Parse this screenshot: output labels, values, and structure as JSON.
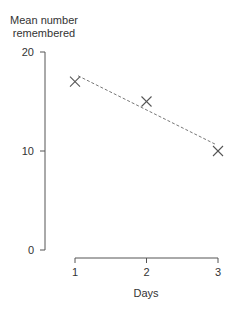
{
  "chart_data": {
    "type": "line",
    "title": "",
    "xlabel": "Days",
    "ylabel": "Mean number remembered",
    "ylabel_lines": [
      "Mean number",
      "remembered"
    ],
    "categories": [
      1,
      2,
      3
    ],
    "x": [
      1,
      2,
      3
    ],
    "series": [
      {
        "name": "Observed",
        "marker": "x",
        "values": [
          17,
          15,
          10
        ]
      }
    ],
    "trend_line": {
      "style": "dashed",
      "x": [
        1,
        3
      ],
      "y": [
        17.6,
        10.7
      ]
    },
    "xticks": [
      "1",
      "2",
      "3"
    ],
    "yticks": [
      "0",
      "10",
      "20"
    ],
    "xlim": [
      1,
      3
    ],
    "ylim": [
      0,
      20
    ],
    "grid": false,
    "legend": null
  },
  "colors": {
    "axis": "#555555",
    "marker": "#555555",
    "trend": "#777777",
    "text": "#333333"
  }
}
